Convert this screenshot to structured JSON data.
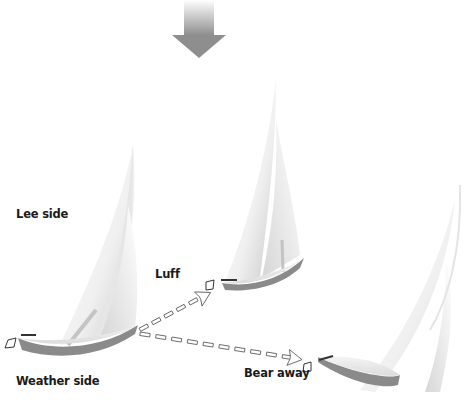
{
  "diagram": {
    "type": "sailing-maneuver-illustration",
    "wind_indicator": {
      "icon": "wind-direction-arrow-icon",
      "direction": "down"
    },
    "labels": {
      "lee_side": "Lee side",
      "weather_side": "Weather side",
      "luff": "Luff",
      "bear_away": "Bear away"
    },
    "boats": [
      {
        "name": "initial-boat",
        "heading": "close-hauled"
      },
      {
        "name": "luff-boat",
        "heading": "into-wind"
      },
      {
        "name": "bear-away-boat",
        "heading": "off-wind"
      }
    ],
    "arrows": [
      {
        "from": "initial-boat",
        "to": "luff-boat",
        "style": "dashed"
      },
      {
        "from": "initial-boat",
        "to": "bear-away-boat",
        "style": "dashed"
      }
    ],
    "colors": {
      "sail": "#f2f2f2",
      "hull_shadow": "#8a8a8a",
      "arrow": "#888888",
      "text": "#1a1a1a"
    }
  }
}
